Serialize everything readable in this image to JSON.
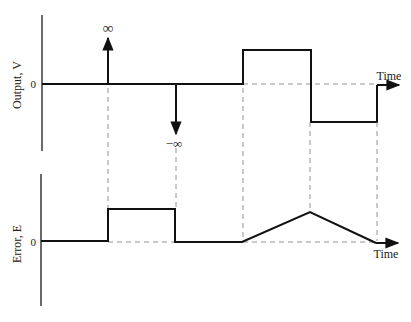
{
  "figure": {
    "type": "timing-diagram",
    "colors": {
      "signal": "#111111",
      "axis": "#1a1a1a",
      "guide": "#888888",
      "background": "#ffffff"
    }
  },
  "top_panel": {
    "ylabel": "Output, V",
    "zero_label": "0",
    "time_label": "Time",
    "impulse_pos_label": "∞",
    "impulse_neg_label": "−∞",
    "segments": [
      "zero until t1",
      "positive impulse (+∞) at t1",
      "zero t1–t2",
      "negative impulse (−∞) at t2",
      "zero t2–t3",
      "positive constant t3–t4",
      "negative constant t4–t5",
      "returns to zero at t5"
    ]
  },
  "bottom_panel": {
    "ylabel": "Error, E",
    "zero_label": "0",
    "time_label": "Time",
    "segments": [
      "zero until t1",
      "positive constant t1–t2",
      "zero t2–t3",
      "linear ramp up t3–t4",
      "linear ramp down t4–t5 to zero"
    ]
  },
  "time_markers": [
    "t1",
    "t2",
    "t3",
    "t4",
    "t5"
  ]
}
